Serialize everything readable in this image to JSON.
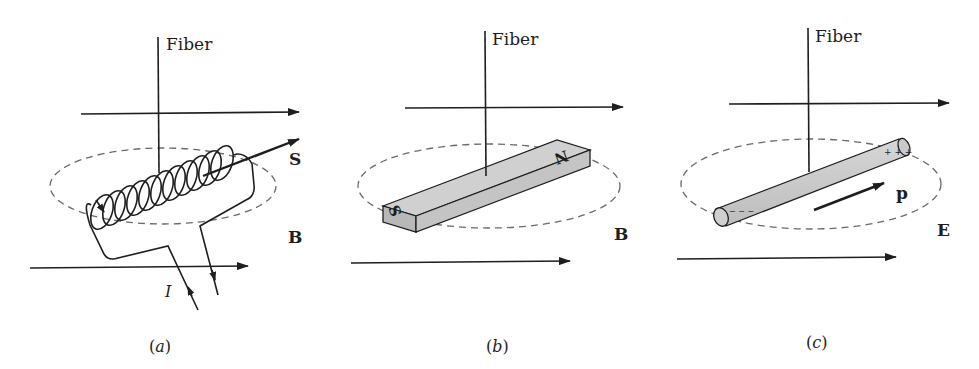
{
  "figure": {
    "panels": [
      {
        "id": "a",
        "caption_letter": "a",
        "fiber_label": "Fiber",
        "object": "current-carrying solenoid (coil)",
        "moment_label": "S",
        "field_label": "B",
        "current_label": "I"
      },
      {
        "id": "b",
        "caption_letter": "b",
        "fiber_label": "Fiber",
        "object": "bar magnet",
        "pole_south": "S",
        "pole_north": "N",
        "field_label": "B"
      },
      {
        "id": "c",
        "caption_letter": "c",
        "fiber_label": "Fiber",
        "object": "electric dipole rod",
        "moment_label": "p",
        "field_label": "E",
        "positive_charges": "+ + +",
        "negative_charges": "− − −"
      }
    ],
    "caption_open": "(",
    "caption_close": ")"
  },
  "colors": {
    "ink": "#1e1e1e",
    "dash": "#6a6a6a",
    "fill_gray": "#cfcfcf",
    "fill_dark": "#b3b3b3",
    "background": "#ffffff"
  }
}
